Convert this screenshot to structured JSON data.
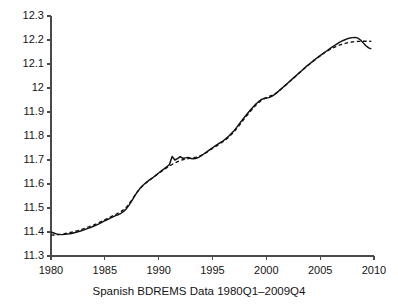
{
  "chart_data": {
    "type": "line",
    "title": "",
    "subtitle": "",
    "xlabel": "Spanish BDREMS Data 1980Q1–2009Q4",
    "ylabel": "",
    "xlim": [
      1980,
      2010
    ],
    "ylim": [
      11.3,
      12.3
    ],
    "grid": false,
    "legend": "none",
    "xticks": [
      1980,
      1985,
      1990,
      1995,
      2000,
      2005,
      2010
    ],
    "xtick_labels": [
      "1980",
      "1985",
      "1990",
      "1995",
      "2000",
      "2005",
      "2010"
    ],
    "yticks": [
      11.3,
      11.4,
      11.5,
      11.6,
      11.7,
      11.8,
      11.9,
      12.0,
      12.1,
      12.2,
      12.3
    ],
    "ytick_labels": [
      "11.3",
      "11.4",
      "11.5",
      "11.6",
      "11.7",
      "11.8",
      "11.9",
      "12",
      "12.1",
      "12.2",
      "12.3"
    ],
    "series": [
      {
        "name": "observed",
        "style": "solid",
        "color": "#111111",
        "x": [
          1980.0,
          1980.25,
          1980.5,
          1980.75,
          1981.0,
          1981.25,
          1981.5,
          1981.75,
          1982.0,
          1982.25,
          1982.5,
          1982.75,
          1983.0,
          1983.25,
          1983.5,
          1983.75,
          1984.0,
          1984.25,
          1984.5,
          1984.75,
          1985.0,
          1985.25,
          1985.5,
          1985.75,
          1986.0,
          1986.25,
          1986.5,
          1986.75,
          1987.0,
          1987.25,
          1987.5,
          1987.75,
          1988.0,
          1988.25,
          1988.5,
          1988.75,
          1989.0,
          1989.25,
          1989.5,
          1989.75,
          1990.0,
          1990.25,
          1990.5,
          1990.75,
          1991.0,
          1991.25,
          1991.5,
          1991.75,
          1992.0,
          1992.25,
          1992.5,
          1992.75,
          1993.0,
          1993.25,
          1993.5,
          1993.75,
          1994.0,
          1994.25,
          1994.5,
          1994.75,
          1995.0,
          1995.25,
          1995.5,
          1995.75,
          1996.0,
          1996.25,
          1996.5,
          1996.75,
          1997.0,
          1997.25,
          1997.5,
          1997.75,
          1998.0,
          1998.25,
          1998.5,
          1998.75,
          1999.0,
          1999.25,
          1999.5,
          1999.75,
          2000.0,
          2000.25,
          2000.5,
          2000.75,
          2001.0,
          2001.25,
          2001.5,
          2001.75,
          2002.0,
          2002.25,
          2002.5,
          2002.75,
          2003.0,
          2003.25,
          2003.5,
          2003.75,
          2004.0,
          2004.25,
          2004.5,
          2004.75,
          2005.0,
          2005.25,
          2005.5,
          2005.75,
          2006.0,
          2006.25,
          2006.5,
          2006.75,
          2007.0,
          2007.25,
          2007.5,
          2007.75,
          2008.0,
          2008.25,
          2008.5,
          2008.75,
          2009.0,
          2009.25,
          2009.5,
          2009.75
        ],
        "y": [
          11.4,
          11.396,
          11.392,
          11.39,
          11.389,
          11.39,
          11.392,
          11.393,
          11.395,
          11.398,
          11.401,
          11.404,
          11.408,
          11.412,
          11.416,
          11.42,
          11.425,
          11.43,
          11.435,
          11.441,
          11.447,
          11.452,
          11.458,
          11.463,
          11.468,
          11.472,
          11.478,
          11.486,
          11.497,
          11.512,
          11.53,
          11.548,
          11.566,
          11.581,
          11.593,
          11.603,
          11.612,
          11.62,
          11.628,
          11.637,
          11.646,
          11.655,
          11.663,
          11.672,
          11.681,
          11.715,
          11.7,
          11.706,
          11.714,
          11.707,
          11.709,
          11.711,
          11.706,
          11.705,
          11.707,
          11.712,
          11.719,
          11.727,
          11.735,
          11.743,
          11.751,
          11.759,
          11.766,
          11.773,
          11.78,
          11.789,
          11.799,
          11.81,
          11.822,
          11.836,
          11.851,
          11.866,
          11.88,
          11.894,
          11.907,
          11.92,
          11.932,
          11.942,
          11.951,
          11.956,
          11.958,
          11.96,
          11.965,
          11.972,
          11.981,
          11.991,
          12.001,
          12.011,
          12.021,
          12.031,
          12.041,
          12.051,
          12.061,
          12.071,
          12.081,
          12.091,
          12.1,
          12.109,
          12.118,
          12.127,
          12.135,
          12.143,
          12.151,
          12.159,
          12.167,
          12.175,
          12.182,
          12.189,
          12.195,
          12.2,
          12.205,
          12.208,
          12.21,
          12.211,
          12.208,
          12.2,
          12.188,
          12.176,
          12.167,
          12.163
        ]
      },
      {
        "name": "fitted",
        "style": "dashed",
        "color": "#111111",
        "x": [
          1980.0,
          1980.5,
          1981.0,
          1981.5,
          1982.0,
          1982.5,
          1983.0,
          1983.5,
          1984.0,
          1984.5,
          1985.0,
          1985.5,
          1986.0,
          1986.5,
          1987.0,
          1987.5,
          1988.0,
          1988.5,
          1989.0,
          1989.5,
          1990.0,
          1990.5,
          1991.0,
          1991.5,
          1992.0,
          1992.5,
          1993.0,
          1993.5,
          1994.0,
          1994.5,
          1995.0,
          1995.5,
          1996.0,
          1996.5,
          1997.0,
          1997.5,
          1998.0,
          1998.5,
          1999.0,
          1999.5,
          2000.0,
          2000.5,
          2001.0,
          2001.5,
          2002.0,
          2002.5,
          2003.0,
          2003.5,
          2004.0,
          2004.5,
          2005.0,
          2005.5,
          2006.0,
          2006.5,
          2007.0,
          2007.5,
          2008.0,
          2008.5,
          2009.0,
          2009.5,
          2009.75
        ],
        "y": [
          11.387,
          11.388,
          11.391,
          11.395,
          11.4,
          11.406,
          11.413,
          11.421,
          11.43,
          11.44,
          11.451,
          11.462,
          11.473,
          11.485,
          11.503,
          11.533,
          11.566,
          11.592,
          11.611,
          11.627,
          11.644,
          11.66,
          11.675,
          11.688,
          11.698,
          11.704,
          11.708,
          11.712,
          11.72,
          11.733,
          11.748,
          11.762,
          11.777,
          11.795,
          11.817,
          11.845,
          11.875,
          11.902,
          11.927,
          11.947,
          11.96,
          11.969,
          11.982,
          12.0,
          12.02,
          12.04,
          12.06,
          12.08,
          12.099,
          12.117,
          12.134,
          12.15,
          12.163,
          12.174,
          12.182,
          12.188,
          12.192,
          12.194,
          12.195,
          12.195,
          12.194
        ]
      }
    ],
    "annotations": []
  },
  "axes": {
    "tick_color": "#4a4a4a",
    "axis_color": "#4a4a4a",
    "background": "#ffffff"
  }
}
